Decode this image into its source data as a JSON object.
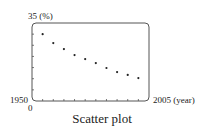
{
  "chart_data": {
    "type": "scatter",
    "title": "Scatter plot",
    "xlabel": "(year)",
    "ylabel": "(%)",
    "xlim": [
      1950,
      2005
    ],
    "ylim": [
      0,
      35
    ],
    "x_tick_interval": 5,
    "y_tick_interval": 5,
    "grid": false,
    "legend": null,
    "labels": {
      "y_max": "35 (%)",
      "x_min": "1950",
      "x_max": "2005 (year)",
      "y_min": "0"
    },
    "x": [
      1955,
      1960,
      1965,
      1970,
      1975,
      1980,
      1985,
      1990,
      1995,
      2000
    ],
    "y": [
      30.0,
      26.0,
      23.3,
      20.6,
      18.8,
      17.0,
      14.8,
      13.0,
      11.7,
      10.3
    ]
  },
  "caption": "Scatter plot"
}
